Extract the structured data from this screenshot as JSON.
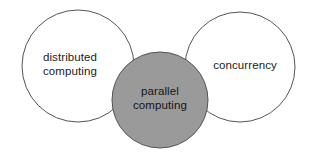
{
  "diagram": {
    "type": "venn-diagram",
    "background_color": "#ffffff",
    "sets": [
      {
        "id": "distributed-computing",
        "label_line_1": "distributed",
        "label_line_2": "computing",
        "fill_color": "#ffffff",
        "stroke_color": "#555555",
        "center_x": 78,
        "center_y": 66,
        "radius": 56,
        "label_center_x": 70,
        "label_center_y": 65
      },
      {
        "id": "parallel-computing",
        "label_line_1": "parallel",
        "label_line_2": "computing",
        "fill_color": "#9a9a9a",
        "stroke_color": "#555555",
        "center_x": 160,
        "center_y": 100,
        "radius": 48,
        "label_center_x": 160,
        "label_center_y": 99
      },
      {
        "id": "concurrency",
        "label_line_1": "concurrency",
        "label_line_2": "",
        "fill_color": "#ffffff",
        "stroke_color": "#555555",
        "center_x": 240,
        "center_y": 67,
        "radius": 55,
        "label_center_x": 245,
        "label_center_y": 66
      }
    ]
  }
}
